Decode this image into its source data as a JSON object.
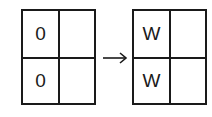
{
  "diagram": {
    "before": {
      "cells": [
        [
          "0",
          ""
        ],
        [
          "0",
          ""
        ]
      ]
    },
    "arrow": "right-arrow",
    "after": {
      "cells": [
        [
          "W",
          ""
        ],
        [
          "W",
          ""
        ]
      ]
    },
    "colors": {
      "stroke": "#1a1a1a",
      "background": "#ffffff"
    }
  }
}
